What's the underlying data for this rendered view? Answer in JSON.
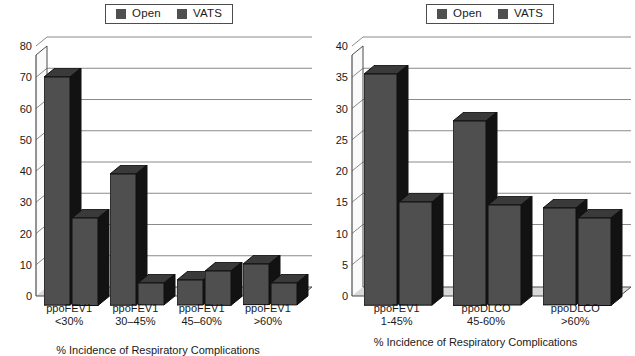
{
  "figure": {
    "legend_labels": [
      "Open",
      "VATS"
    ],
    "series_colors": [
      "#4f4f4f",
      "#4f4f4f"
    ]
  },
  "chart_data": [
    {
      "type": "bar",
      "title": "",
      "xlabel": "% Incidence of Respiratory Complications",
      "ylabel": "",
      "ylim": [
        0,
        80
      ],
      "ytick_labels": [
        "0",
        "10",
        "20",
        "30",
        "40",
        "50",
        "60",
        "70",
        "80"
      ],
      "ytick_values": [
        0,
        10,
        20,
        30,
        40,
        50,
        60,
        70,
        80
      ],
      "grid": true,
      "legend_position": "top",
      "categories": [
        "ppoFEV1 <30%",
        "ppoFEV1 30-45%",
        "ppoFEV1 45-60%",
        "ppoFEV1 >60%"
      ],
      "category_lines": [
        [
          "ppoFEV1",
          "<30%"
        ],
        [
          "ppoFEV1",
          "30–45%"
        ],
        [
          "ppoFEV1",
          "45–60%"
        ],
        [
          "ppoFEV1",
          ">60%"
        ]
      ],
      "series": [
        {
          "name": "Open",
          "values": [
            73,
            42,
            8,
            13
          ]
        },
        {
          "name": "VATS",
          "values": [
            28,
            7,
            11,
            7
          ]
        }
      ]
    },
    {
      "type": "bar",
      "title": "",
      "xlabel": "% Incidence of Respiratory Complications",
      "ylabel": "",
      "ylim": [
        0,
        40
      ],
      "ytick_labels": [
        "0",
        "5",
        "10",
        "15",
        "20",
        "25",
        "30",
        "35",
        "40"
      ],
      "ytick_values": [
        0,
        5,
        10,
        15,
        20,
        25,
        30,
        35,
        40
      ],
      "grid": true,
      "legend_position": "top",
      "categories": [
        "ppoFEV1 1-45%",
        "ppoDLCO 45-60%",
        "ppoDLCO >60%"
      ],
      "category_lines": [
        [
          "ppoFEV1",
          "1-45%"
        ],
        [
          "ppoDLCO",
          "45-60%"
        ],
        [
          "ppoDLCO",
          ">60%"
        ]
      ],
      "series": [
        {
          "name": "Open",
          "values": [
            37,
            29.5,
            15.5
          ]
        },
        {
          "name": "VATS",
          "values": [
            16.5,
            16,
            14
          ]
        }
      ]
    }
  ]
}
